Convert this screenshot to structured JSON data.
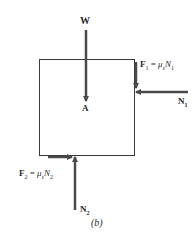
{
  "diagram": {
    "type": "free-body diagram",
    "caption": "(b)",
    "labels": {
      "weight": "W",
      "center": "A",
      "friction1_lhs": "F",
      "friction1_sub": "1",
      "friction1_eq": " = ",
      "friction1_mu": "μ",
      "friction1_mu_sub": "s",
      "friction1_N": "N",
      "friction1_N_sub": "1",
      "normal1": "N",
      "normal1_sub": "1",
      "friction2_lhs": "F",
      "friction2_sub": "2",
      "friction2_eq": " = ",
      "friction2_mu": "μ",
      "friction2_mu_sub": "s",
      "friction2_N": "N",
      "friction2_N_sub": "2",
      "normal2": "N",
      "normal2_sub": "2"
    },
    "colors": {
      "arrow": "#4a4a4a",
      "box": "#3a3a3a",
      "text": "#2a2a2a"
    }
  }
}
